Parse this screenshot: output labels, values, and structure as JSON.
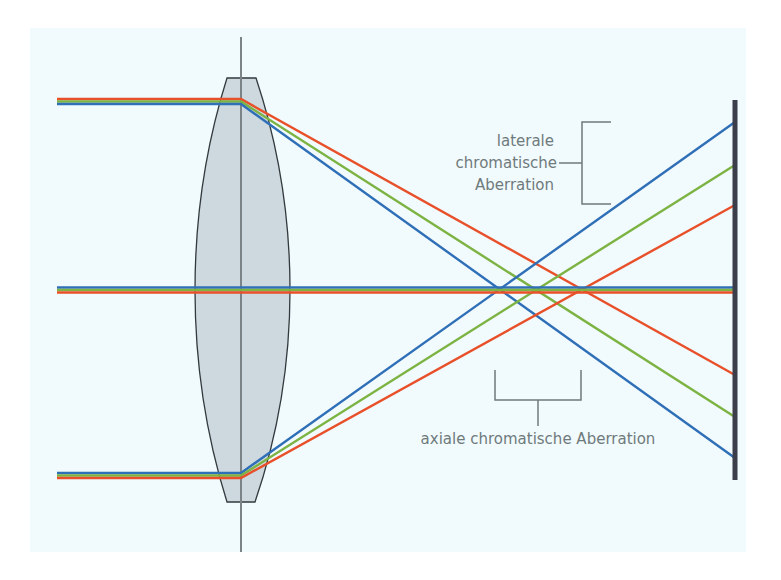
{
  "diagram": {
    "colors": {
      "background": "#f1fafc",
      "lens_fill": "#cdd8df",
      "lens_stroke": "#333a3e",
      "axis_line": "#7c8488",
      "screen": "#3b3d4a",
      "red": "#e8502a",
      "green": "#7cb342",
      "blue": "#2f6fb7",
      "annotation": "#6f7a7c"
    },
    "labels": {
      "lateral_line1": "laterale",
      "lateral_line2": "chromatische",
      "lateral_line3": "Aberration",
      "axial": "axiale chromatische Aberration"
    },
    "rays": {
      "top_input_y": 101,
      "middle_y": 290,
      "bottom_input_y": 475,
      "lens_x": 241,
      "screen_x": 735,
      "screen_hits_top_origin": {
        "blue": 458,
        "green": 417,
        "red": 375
      },
      "screen_hits_bottom_origin": {
        "blue": 122,
        "green": 165,
        "red": 205
      },
      "axis_crossings_x": {
        "blue": 492,
        "green": 530,
        "red": 577
      }
    }
  }
}
